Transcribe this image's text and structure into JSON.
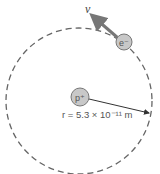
{
  "diagram": {
    "electron": {
      "label": "e⁻",
      "fill": "#c8c8c8"
    },
    "proton": {
      "label": "p⁺",
      "fill": "#c8c8c8"
    },
    "velocity": {
      "label": "v",
      "color": "#777777"
    },
    "radius": {
      "label": "r = 5.3 × 10⁻¹¹ m"
    },
    "orbit": {
      "style": "dashed",
      "color": "#666666"
    }
  }
}
